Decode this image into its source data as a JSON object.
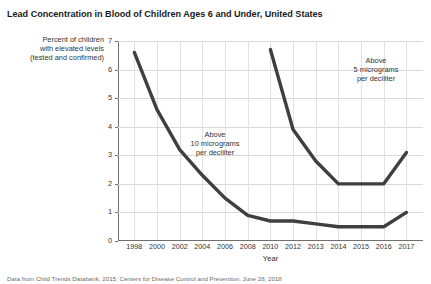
{
  "chart_data": {
    "type": "line",
    "title": "Lead Concentration in Blood of Children Ages 6 and Under, United States",
    "xlabel": "Year",
    "ylabel": "Percent of children with elevated levels (tested and confirmed)",
    "ylabel_lines": [
      "Percent of children",
      "with elevated levels",
      "(tested and confirmed)"
    ],
    "ylim": [
      0,
      7
    ],
    "yticks": [
      0,
      1,
      2,
      3,
      4,
      5,
      6,
      7
    ],
    "grid": true,
    "legend_position": "inline-annotation",
    "categories": [
      "1998",
      "2000",
      "2002",
      "2004",
      "2006",
      "2008",
      "2010",
      "2012",
      "2013",
      "2014",
      "2015",
      "2016",
      "2017"
    ],
    "series": [
      {
        "name": "Above 10 micrograms per deciliter",
        "x": [
          1998,
          2000,
          2002,
          2004,
          2006,
          2008,
          2010,
          2012,
          2013,
          2014,
          2015,
          2016,
          2017
        ],
        "values": [
          6.6,
          4.6,
          3.2,
          2.3,
          1.5,
          0.9,
          0.7,
          0.7,
          0.6,
          0.5,
          0.5,
          0.5,
          1.0
        ]
      },
      {
        "name": "Above 5 micrograms per deciliter",
        "x": [
          2010,
          2012,
          2013,
          2014,
          2015,
          2016,
          2017
        ],
        "values": [
          6.7,
          3.9,
          2.8,
          2.0,
          2.0,
          2.0,
          3.1
        ]
      }
    ],
    "annotations": [
      {
        "id": "above-10",
        "lines": [
          "Above",
          "10 micrograms",
          "per deciliter"
        ]
      },
      {
        "id": "above-5",
        "lines": [
          "Above",
          "5 micrograms",
          "per deciliter"
        ]
      }
    ],
    "colors": {
      "line": "#3f3f3f",
      "grid": "#d9d9d9",
      "axis": "#6f6f6f",
      "text": "#333333"
    }
  },
  "footnote": "Data from Child Trends Databank, 2015; Centers for Disease Control and Prevention, June 28, 2018"
}
